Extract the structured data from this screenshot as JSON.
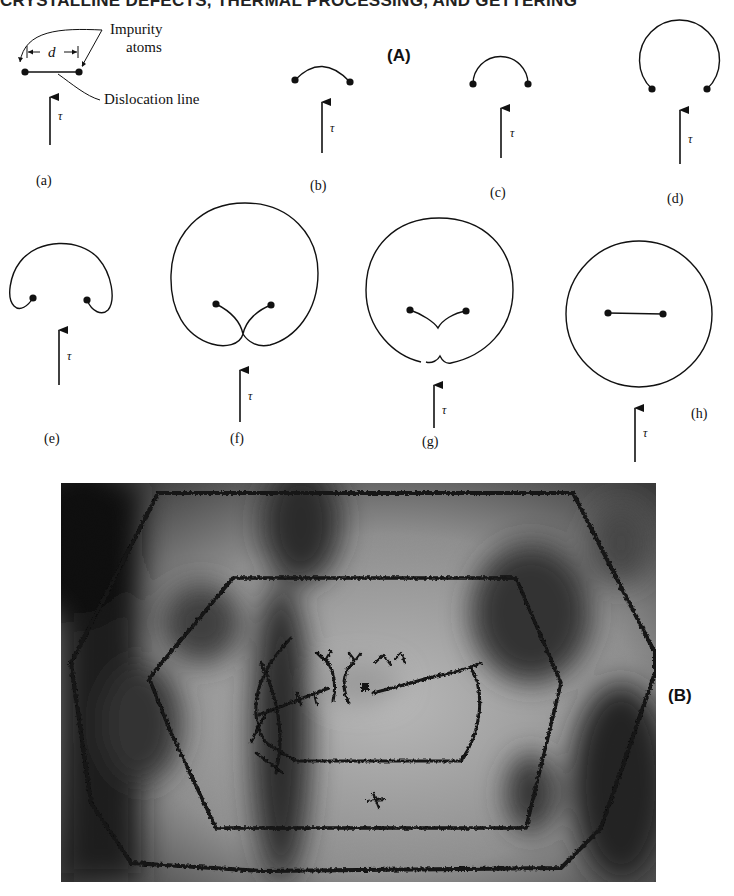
{
  "header": {
    "title": "CRYSTALLINE DEFECTS, THERMAL PROCESSING, AND GETTERING"
  },
  "figure": {
    "panel_a_label": "(A)",
    "panel_b_label": "(B)",
    "stress_symbol": "τ",
    "annotations": {
      "impurity_atoms_line1": "Impurity",
      "impurity_atoms_line2": "atoms",
      "dislocation_line": "Dislocation line",
      "spacing_symbol": "d"
    },
    "stages": [
      {
        "id": "a",
        "label": "(a)",
        "description": "straight dislocation line pinned between two impurity atoms"
      },
      {
        "id": "b",
        "label": "(b)",
        "description": "line bows slightly under stress"
      },
      {
        "id": "c",
        "label": "(c)",
        "description": "line bows to semicircle"
      },
      {
        "id": "d",
        "label": "(d)",
        "description": "line bows beyond semicircle"
      },
      {
        "id": "e",
        "label": "(e)",
        "description": "loop wraps around pinning points"
      },
      {
        "id": "f",
        "label": "(f)",
        "description": "loop segments meet below pinning points"
      },
      {
        "id": "g",
        "label": "(g)",
        "description": "segments annihilate, loop pinches off"
      },
      {
        "id": "h",
        "label": "(h)",
        "description": "closed loop released, new line segment regenerated"
      }
    ],
    "micrograph": {
      "description": "Electron micrograph of concentric hexagonal dislocation loops emitted from a Frank-Read source",
      "colors": {
        "dark": "#1a1a1a",
        "mid": "#6b6b6b",
        "light": "#c8c8c8"
      }
    }
  }
}
